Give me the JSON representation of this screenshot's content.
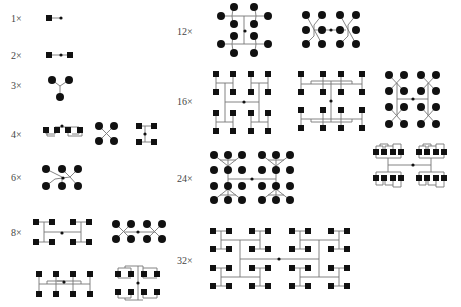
{
  "labels": {
    "x1": "1×",
    "x2": "2×",
    "x3": "3×",
    "x4": "4×",
    "x6": "6×",
    "x8": "8×",
    "x12": "12×",
    "x16": "16×",
    "x24": "24×",
    "x32": "32×"
  },
  "legend": {
    "square": "square element (patch)",
    "circle": "circular element",
    "center_dot": "feed point",
    "line": "feed line"
  },
  "groups": [
    {
      "label": "1×",
      "variants": 1,
      "element": "square"
    },
    {
      "label": "2×",
      "variants": 1,
      "element": "square"
    },
    {
      "label": "3×",
      "variants": 1,
      "element": "circle"
    },
    {
      "label": "4×",
      "variants": 3,
      "element": "square/circle/square"
    },
    {
      "label": "6×",
      "variants": 1,
      "element": "circle"
    },
    {
      "label": "8×",
      "variants": 4,
      "element": "square/circle/square/square"
    },
    {
      "label": "12×",
      "variants": 2,
      "element": "circle"
    },
    {
      "label": "16×",
      "variants": 3,
      "element": "square/square/circle"
    },
    {
      "label": "24×",
      "variants": 2,
      "element": "circle/square"
    },
    {
      "label": "32×",
      "variants": 1,
      "element": "square"
    }
  ]
}
